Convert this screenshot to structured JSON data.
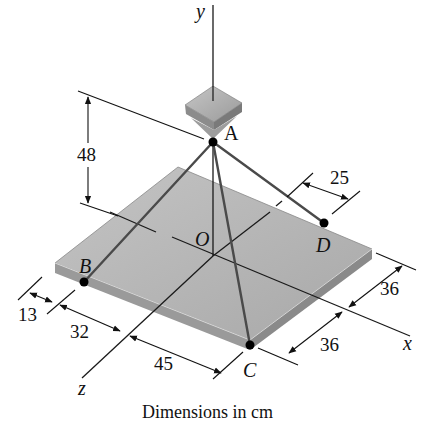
{
  "figure": {
    "caption": "Dimensions in cm",
    "axes": {
      "x": "x",
      "y": "y",
      "z": "z"
    },
    "points": {
      "A": "A",
      "B": "B",
      "C": "C",
      "D": "D",
      "O": "O"
    },
    "dimensions": {
      "height_A": "48",
      "d_offset": "25",
      "x_right_upper": "36",
      "x_right_lower": "36",
      "z_left_13": "13",
      "z_left_32": "32",
      "z_front_45": "45"
    },
    "colors": {
      "plate_top": "#b4b4b4",
      "plate_edge": "#8e8e8e",
      "block": "#a6a6a6",
      "line": "#222222",
      "cable": "#4a4a4a"
    }
  }
}
